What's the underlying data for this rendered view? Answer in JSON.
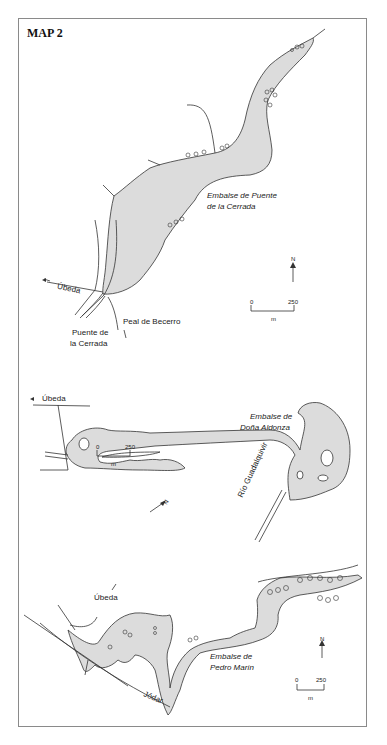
{
  "title": "MAP 2",
  "colors": {
    "water": "#dcdcdc",
    "line": "#333333",
    "frame": "#8a8a8a"
  },
  "maps": [
    {
      "reservoir": "Embalse de Puente de la Cerrada",
      "reservoir_line1": "Embalse de Puente",
      "reservoir_line2": "de la Cerrada",
      "places": {
        "ubeda": "Úbeda",
        "peal": "Peal de Becerro",
        "bridge_line1": "Puente de",
        "bridge_line2": "la Cerrada"
      },
      "north": "N",
      "scale": {
        "start": "0",
        "end": "250",
        "unit": "m"
      }
    },
    {
      "reservoir": "Embalse de Doña Aldonza",
      "reservoir_line1": "Embalse de",
      "reservoir_line2": "Doña Aldonza",
      "places": {
        "ubeda": "Úbeda",
        "river": "Río Guadalquivir"
      },
      "north": "N",
      "scale": {
        "start": "0",
        "end": "250",
        "unit": "m"
      }
    },
    {
      "reservoir": "Embalse de Pedro Marín",
      "reservoir_line1": "Embalse de",
      "reservoir_line2": "Pedro Marín",
      "places": {
        "ubeda": "Úbeda",
        "jodar": "Jódar"
      },
      "north": "N",
      "scale": {
        "start": "0",
        "end": "250",
        "unit": "m"
      }
    }
  ]
}
